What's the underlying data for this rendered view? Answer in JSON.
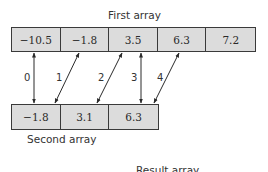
{
  "first_array": {
    "label": "First array",
    "cells": [
      "−10.5",
      "−1.8",
      "3.5",
      "6.3",
      "7.2"
    ]
  },
  "second_array": {
    "label": "Second array",
    "cells": [
      "−1.8",
      "3.1",
      "6.3"
    ]
  },
  "result_array": {
    "label": "Result array"
  },
  "mappings": [
    {
      "index": "0",
      "from_first": 0,
      "to_second": 0
    },
    {
      "index": "1",
      "from_first": 1,
      "to_second": 0
    },
    {
      "index": "2",
      "from_first": 2,
      "to_second": 1
    },
    {
      "index": "3",
      "from_first": 2,
      "to_second": 2
    },
    {
      "index": "4",
      "from_first": 3,
      "to_second": 2
    }
  ],
  "colors": {
    "cell_fill": "#dcdcdc",
    "border": "#3a3a3a",
    "text": "#2a2a2a"
  }
}
